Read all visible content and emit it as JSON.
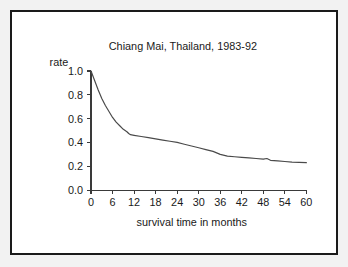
{
  "figure": {
    "border_color": "#1a1a1a",
    "page_background": "#f2f2f2",
    "plot_background": "#ffffff"
  },
  "chart_data": {
    "type": "line",
    "title": "Chiang Mai, Thailand, 1983-92",
    "subtitle": "",
    "xlabel": "survival time in months",
    "ylabel": "rate",
    "xlim": [
      0,
      60
    ],
    "ylim": [
      0.0,
      1.0
    ],
    "xticks": [
      0,
      6,
      12,
      18,
      24,
      30,
      36,
      42,
      48,
      54,
      60
    ],
    "xtick_labels": [
      "0",
      "6",
      "12",
      "18",
      "24",
      "30",
      "36",
      "42",
      "48",
      "54",
      "60"
    ],
    "yticks": [
      0.0,
      0.2,
      0.4,
      0.6,
      0.8,
      1.0
    ],
    "ytick_labels": [
      "0.0",
      "0.2",
      "0.4",
      "0.6",
      "0.8",
      "1.0"
    ],
    "grid": false,
    "legend": false,
    "legend_position": "none",
    "line_color": "#4a4a4a",
    "series": [
      {
        "name": "survival rate",
        "x": [
          0,
          1,
          2,
          3,
          4,
          5,
          6,
          7,
          8,
          9,
          10,
          10.5,
          11,
          12,
          14,
          16,
          18,
          20,
          22,
          24,
          26,
          28,
          30,
          32,
          34,
          36,
          38,
          40,
          42,
          44,
          46,
          48,
          49,
          50,
          52,
          54,
          56,
          58,
          60
        ],
        "y": [
          1.0,
          0.92,
          0.84,
          0.77,
          0.71,
          0.66,
          0.61,
          0.57,
          0.54,
          0.51,
          0.49,
          0.475,
          0.465,
          0.46,
          0.45,
          0.44,
          0.43,
          0.42,
          0.41,
          0.4,
          0.385,
          0.37,
          0.355,
          0.34,
          0.325,
          0.3,
          0.285,
          0.28,
          0.275,
          0.27,
          0.265,
          0.26,
          0.265,
          0.25,
          0.245,
          0.24,
          0.235,
          0.232,
          0.23
        ]
      }
    ]
  }
}
